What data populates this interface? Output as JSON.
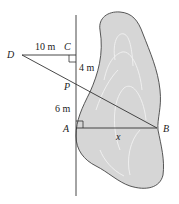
{
  "diagram": {
    "points": {
      "D": {
        "label": "D",
        "x": 22,
        "y": 55
      },
      "C": {
        "label": "C",
        "x": 76,
        "y": 55
      },
      "P": {
        "label": "P",
        "x": 76,
        "y": 86
      },
      "A": {
        "label": "A",
        "x": 76,
        "y": 128
      },
      "B": {
        "label": "B",
        "x": 157,
        "y": 128
      }
    },
    "measurements": {
      "DC": "10 m",
      "CP": "4 m",
      "PA": "6 m",
      "AB": "x"
    },
    "colors": {
      "line": "#333333",
      "island_fill": "#d6d6d6",
      "island_stroke": "#444444",
      "contour": "#f2f2f2"
    }
  }
}
